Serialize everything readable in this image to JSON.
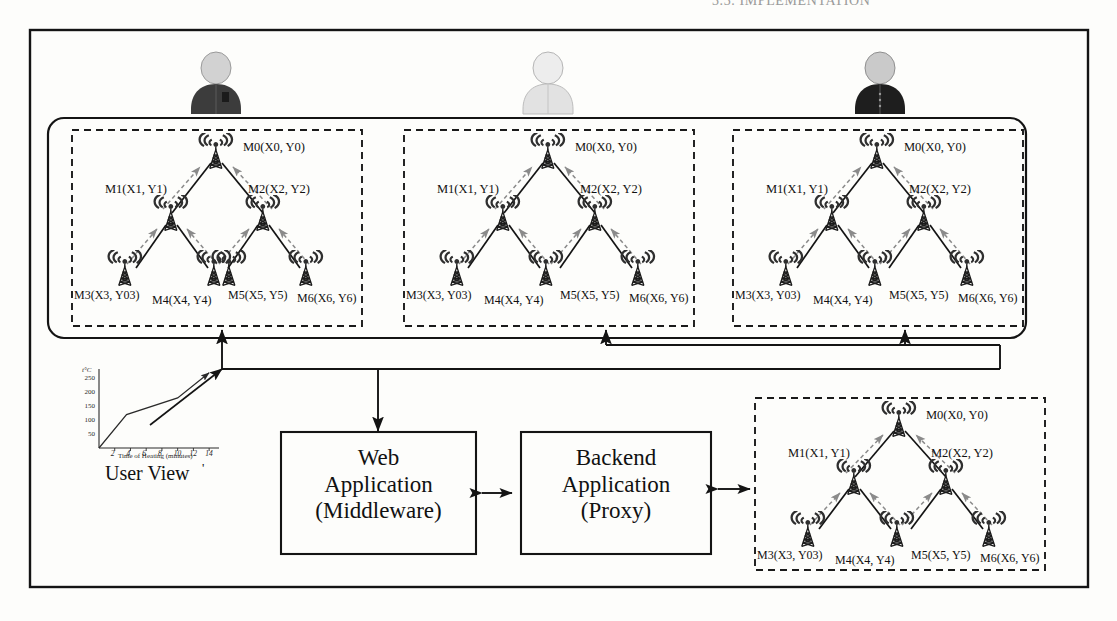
{
  "page": {
    "running_header": "3.3. IMPLEMENTATION"
  },
  "users": [
    {
      "name": "user-avatar-dark",
      "shirt": "#3c3c3c",
      "head": "#cfcfcf"
    },
    {
      "name": "user-avatar-light",
      "shirt": "#e2e2e2",
      "head": "#ececec"
    },
    {
      "name": "user-avatar-black",
      "shirt": "#1e1e1e",
      "head": "#c8c8c8"
    }
  ],
  "mesh": {
    "nodes": {
      "m0": "M0(X0, Y0)",
      "m1": "M1(X1, Y1)",
      "m2": "M2(X2, Y2)",
      "m3": "M3(X3, Y03)",
      "m4": "M4(X4, Y4)",
      "m5": "M5(X5, Y5)",
      "m6": "M6(X6, Y6)"
    },
    "clusters": [
      "mesh-cluster-1",
      "mesh-cluster-2",
      "mesh-cluster-3",
      "mesh-cluster-backend"
    ]
  },
  "boxes": {
    "web": {
      "line1": "Web",
      "line2": "Application",
      "line3": "(Middleware)"
    },
    "backend": {
      "line1": "Backend",
      "line2": "Application",
      "line3": "(Proxy)"
    }
  },
  "user_view": {
    "caption": "User View",
    "tick_mark": "'"
  },
  "chart_data": {
    "type": "line",
    "title": "",
    "xlabel": "Time of Heating (minutes)",
    "ylabel": "t°C",
    "x": [
      0,
      3.5,
      10,
      14
    ],
    "y": [
      0,
      120,
      180,
      270
    ],
    "xticks": [
      2,
      4,
      6,
      8,
      10,
      12,
      14
    ],
    "yticks": [
      50,
      100,
      150,
      200,
      250
    ],
    "xlim": [
      0,
      15
    ],
    "ylim": [
      0,
      280
    ],
    "grid": false,
    "legend": null,
    "series": [
      {
        "name": "heating-curve",
        "x": [
          0,
          3.5,
          10,
          14
        ],
        "y": [
          0,
          120,
          180,
          270
        ]
      }
    ]
  },
  "colors": {
    "stroke": "#141414",
    "dashed": "#1a1a1a",
    "arrow_dashed": "#6e6e6e",
    "paper": "#fdfdfb"
  }
}
